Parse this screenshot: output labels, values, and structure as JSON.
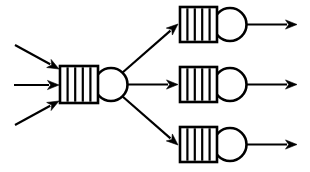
{
  "diagram": {
    "type": "queueing-network",
    "canvas": {
      "width": 310,
      "height": 172,
      "background": "#ffffff"
    },
    "style": {
      "line_color": "#000000",
      "fill_color": "#ffffff",
      "stroke_width": 2.6,
      "divider_stroke_width": 2.2
    },
    "stations": [
      {
        "id": "station-center",
        "label": "central-station",
        "queue": {
          "x": 60,
          "y": 66,
          "width": 38,
          "height": 37,
          "slots": 5,
          "divider_count": 4,
          "dividers_x": [
            67.6,
            75.2,
            82.8,
            90.4
          ]
        },
        "server": {
          "cx": 111,
          "cy": 84.5,
          "r": 16.5
        }
      },
      {
        "id": "station-top",
        "label": "top-station",
        "queue": {
          "x": 180,
          "y": 7,
          "width": 37,
          "height": 35,
          "slots": 5,
          "divider_count": 4,
          "dividers_x": [
            187.4,
            194.8,
            202.2,
            209.6
          ]
        },
        "server": {
          "cx": 230,
          "cy": 24.5,
          "r": 16.5
        }
      },
      {
        "id": "station-middle",
        "label": "middle-station",
        "queue": {
          "x": 180,
          "y": 67,
          "width": 37,
          "height": 35,
          "slots": 5,
          "divider_count": 4,
          "dividers_x": [
            187.4,
            194.8,
            202.2,
            209.6
          ]
        },
        "server": {
          "cx": 230,
          "cy": 84.5,
          "r": 16.5
        }
      },
      {
        "id": "station-bottom",
        "label": "bottom-station",
        "queue": {
          "x": 180,
          "y": 127,
          "width": 37,
          "height": 35,
          "slots": 5,
          "divider_count": 4,
          "dividers_x": [
            187.4,
            194.8,
            202.2,
            209.6
          ]
        },
        "server": {
          "cx": 230,
          "cy": 144.5,
          "r": 16.5
        }
      }
    ],
    "arrows": [
      {
        "id": "arrival-top",
        "label": "arrival-arrow-top",
        "kind": "input",
        "x1": 15,
        "y1": 45,
        "x2": 59,
        "y2": 69
      },
      {
        "id": "arrival-middle",
        "label": "arrival-arrow-middle",
        "kind": "input",
        "x1": 14,
        "y1": 85,
        "x2": 59,
        "y2": 85
      },
      {
        "id": "arrival-bottom",
        "label": "arrival-arrow-bottom",
        "kind": "input",
        "x1": 15,
        "y1": 125,
        "x2": 59,
        "y2": 101
      },
      {
        "id": "branch-top",
        "label": "branch-arrow-top",
        "kind": "branch",
        "x1": 122,
        "y1": 73,
        "x2": 178,
        "y2": 24
      },
      {
        "id": "branch-middle",
        "label": "branch-arrow-middle",
        "kind": "branch",
        "x1": 128,
        "y1": 84.5,
        "x2": 178,
        "y2": 84.5
      },
      {
        "id": "branch-bottom",
        "label": "branch-arrow-bottom",
        "kind": "branch",
        "x1": 122,
        "y1": 96,
        "x2": 178,
        "y2": 145
      },
      {
        "id": "exit-top",
        "label": "departure-arrow-top",
        "kind": "output",
        "x1": 247,
        "y1": 24.5,
        "x2": 297,
        "y2": 24.5
      },
      {
        "id": "exit-middle",
        "label": "departure-arrow-middle",
        "kind": "output",
        "x1": 247,
        "y1": 84.5,
        "x2": 297,
        "y2": 84.5
      },
      {
        "id": "exit-bottom",
        "label": "departure-arrow-bottom",
        "kind": "output",
        "x1": 247,
        "y1": 144.5,
        "x2": 297,
        "y2": 144.5
      }
    ]
  }
}
